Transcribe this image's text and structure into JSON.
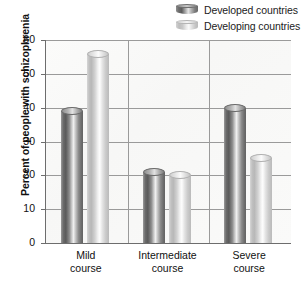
{
  "chart_data": {
    "type": "bar",
    "title": "",
    "subtitle": "",
    "xlabel": "",
    "ylabel": "Percent of people with schizophrenia",
    "categories": [
      "Mild course",
      "Intermediate course",
      "Severe course"
    ],
    "category_lines": [
      [
        "Mild",
        "course"
      ],
      [
        "Intermediate",
        "course"
      ],
      [
        "Severe",
        "course"
      ]
    ],
    "series": [
      {
        "name": "Developed countries",
        "values": [
          39,
          21,
          40
        ],
        "color": "#6e6e6e"
      },
      {
        "name": "Developing countries",
        "values": [
          56,
          20,
          25
        ],
        "color": "#d0d0d0"
      }
    ],
    "ylim": [
      0,
      60
    ],
    "ytick_values": [
      0,
      10,
      20,
      30,
      40,
      50,
      60
    ],
    "ytick_labels": [
      "0",
      "10",
      "20",
      "30",
      "40",
      "50",
      "60"
    ],
    "grid": "horizontal-and-vertical-category-separators",
    "legend_position": "top-right",
    "bar_style": "3d-cylinder-gradient"
  },
  "legend": {
    "items": [
      {
        "label": "Developed countries",
        "swatch": "cylinder-dark-icon"
      },
      {
        "label": "Developing countries",
        "swatch": "cylinder-light-icon"
      }
    ]
  },
  "axes": {
    "y_title": "Percent of people with schizophrenia",
    "y_ticks": [
      "60",
      "50",
      "40",
      "30",
      "20",
      "10",
      "0"
    ]
  },
  "colors": {
    "plot_background": "#faf9f8",
    "gridline": "#9a9a9a",
    "axis_line": "#6d6d6d",
    "text": "#111111",
    "developed_bar": "#6e6e6e",
    "developing_bar": "#d0d0d0"
  }
}
